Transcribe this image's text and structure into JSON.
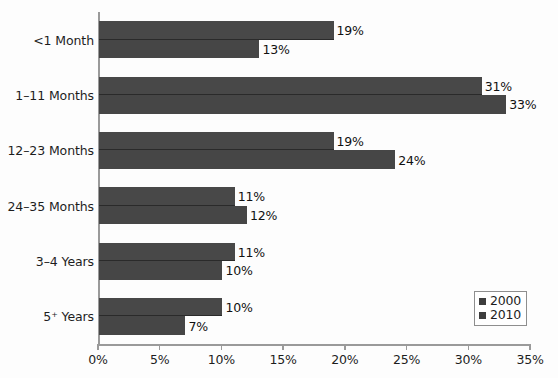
{
  "chart_data": {
    "type": "bar",
    "orientation": "horizontal",
    "title": "",
    "subtitle": "",
    "xlabel": "",
    "ylabel": "",
    "categories": [
      "<1 Month",
      "1–11 Months",
      "12–23 Months",
      "24–35 Months",
      "3–4 Years",
      "5⁺ Years"
    ],
    "series": [
      {
        "name": "2000",
        "values": [
          19,
          31,
          19,
          11,
          11,
          10
        ],
        "labels": [
          "19%",
          "31%",
          "19%",
          "11%",
          "11%",
          "10%"
        ],
        "color": "#484848"
      },
      {
        "name": "2010",
        "values": [
          13,
          33,
          24,
          12,
          10,
          7
        ],
        "labels": [
          "13%",
          "33%",
          "24%",
          "12%",
          "10%",
          "7%"
        ],
        "color": "#464646"
      }
    ],
    "xlim": [
      0,
      35
    ],
    "xticks": [
      0,
      5,
      10,
      15,
      20,
      25,
      30,
      35
    ],
    "xtick_labels": [
      "0%",
      "5%",
      "10%",
      "15%",
      "20%",
      "25%",
      "30%",
      "35%"
    ],
    "grid": false,
    "legend_position": "bottom-right",
    "legend_entries": [
      "2000",
      "2010"
    ],
    "axis_color": "#9a9a9a",
    "text_color": "#1d1d1d",
    "background": "#fdfdfd"
  }
}
